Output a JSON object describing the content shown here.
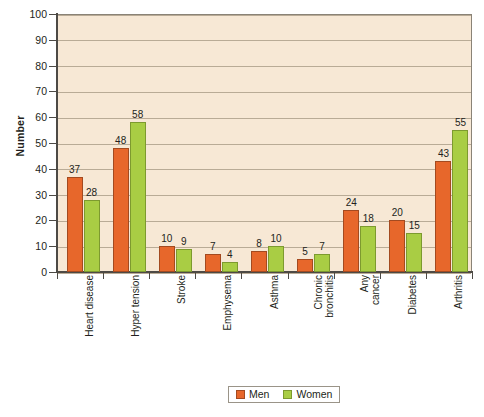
{
  "chart_data": {
    "type": "bar",
    "title": "",
    "xlabel": "",
    "ylabel": "Number",
    "ylim": [
      0,
      100
    ],
    "ytick_step": 10,
    "grid": true,
    "legend_position": "bottom-center",
    "categories": [
      "Heart disease",
      "Hyper tension",
      "Stroke",
      "Emphysema",
      "Asthma",
      "Chronic\nbronchitis",
      "Any\ncancer",
      "Diabetes",
      "Arthritis"
    ],
    "yticks": [
      "0",
      "10",
      "20",
      "30",
      "40",
      "50",
      "60",
      "70",
      "80",
      "90",
      "100"
    ],
    "series": [
      {
        "name": "Men",
        "color": "#e7672b",
        "values": [
          37,
          48,
          10,
          7,
          8,
          5,
          24,
          20,
          43
        ]
      },
      {
        "name": "Women",
        "color": "#a9cd44",
        "values": [
          28,
          58,
          9,
          4,
          10,
          7,
          18,
          15,
          55
        ]
      }
    ]
  },
  "legend": {
    "items": [
      {
        "label": "Men",
        "color": "#e7672b"
      },
      {
        "label": "Women",
        "color": "#a9cd44"
      }
    ]
  },
  "axis": {
    "y_title": "Number"
  },
  "colors": {
    "plot_background": "#f7e8d5",
    "gridline": "#b9ab96",
    "axis": "#4d4a45",
    "men": "#e7672b",
    "women": "#a9cd44",
    "text": "#231f20"
  }
}
